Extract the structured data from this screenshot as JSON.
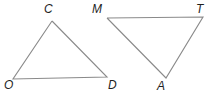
{
  "figure": {
    "background_color": "#ffffff",
    "stroke_color": "#8a8a8a",
    "label_color": "#1f1f1f",
    "width": 214,
    "height": 98,
    "shapes": [
      {
        "name": "triangle-cod",
        "type": "triangle",
        "vertices": [
          {
            "label": "C",
            "x": 52,
            "y": 21,
            "label_x": 44,
            "label_y": 3
          },
          {
            "label": "D",
            "x": 107,
            "y": 77,
            "label_x": 108,
            "label_y": 79
          },
          {
            "label": "O",
            "x": 13,
            "y": 79,
            "label_x": 4,
            "label_y": 79
          }
        ],
        "points": "52,21 107,77 13,79 52,21"
      },
      {
        "name": "triangle-mta",
        "type": "triangle",
        "vertices": [
          {
            "label": "M",
            "x": 107,
            "y": 18,
            "label_x": 92,
            "label_y": 3
          },
          {
            "label": "T",
            "x": 203,
            "y": 17,
            "label_x": 196,
            "label_y": 3
          },
          {
            "label": "A",
            "x": 166,
            "y": 78,
            "label_x": 157,
            "label_y": 80
          }
        ],
        "points": "107,18 203,17 166,78 107,18"
      }
    ]
  }
}
